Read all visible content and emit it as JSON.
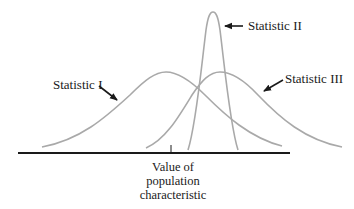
{
  "diagram": {
    "type": "overlapping-distributions",
    "colors": {
      "curve": "#a9a9a9",
      "axis": "#1a1a1a",
      "arrow": "#1a1a1a",
      "text": "#1a1a1a"
    },
    "axis": {
      "caption_lines": [
        "Value of",
        "population",
        "characteristic"
      ]
    },
    "curves": [
      {
        "id": "statistic-1",
        "label": "Statistic I"
      },
      {
        "id": "statistic-2",
        "label": "Statistic II"
      },
      {
        "id": "statistic-3",
        "label": "Statistic III"
      }
    ]
  }
}
